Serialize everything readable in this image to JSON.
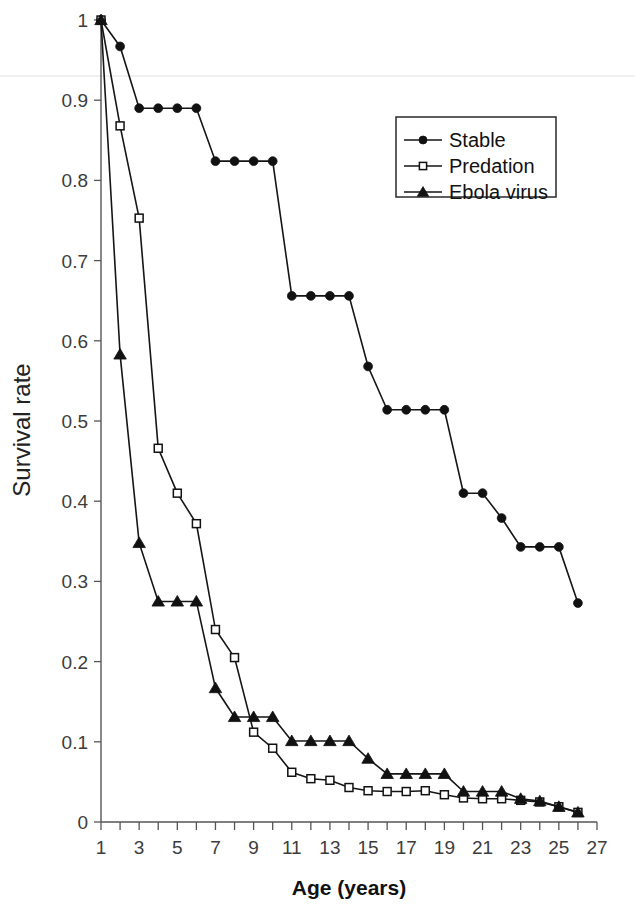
{
  "chart_data": {
    "type": "line",
    "title": "",
    "xlabel": "Age (years)",
    "ylabel": "Survival rate",
    "xlim": [
      1,
      27
    ],
    "ylim": [
      0,
      1
    ],
    "grid": false,
    "legend_position": "top-right",
    "x_tick_labels": [
      "1",
      "3",
      "5",
      "7",
      "9",
      "11",
      "13",
      "15",
      "17",
      "19",
      "21",
      "23",
      "25",
      "27"
    ],
    "x_tick_values": [
      1,
      3,
      5,
      7,
      9,
      11,
      13,
      15,
      17,
      19,
      21,
      23,
      25,
      27
    ],
    "x_minor_ticks": [
      1,
      2,
      3,
      4,
      5,
      6,
      7,
      8,
      9,
      10,
      11,
      12,
      13,
      14,
      15,
      16,
      17,
      18,
      19,
      20,
      21,
      22,
      23,
      24,
      25,
      26,
      27
    ],
    "y_tick_labels": [
      "0",
      "0.1",
      "0.2",
      "0.3",
      "0.4",
      "0.5",
      "0.6",
      "0.7",
      "0.8",
      "0.9",
      "1"
    ],
    "y_tick_values": [
      0,
      0.1,
      0.2,
      0.3,
      0.4,
      0.5,
      0.6,
      0.7,
      0.8,
      0.9,
      1
    ],
    "x": [
      1,
      2,
      3,
      4,
      5,
      6,
      7,
      8,
      9,
      10,
      11,
      12,
      13,
      14,
      15,
      16,
      17,
      18,
      19,
      20,
      21,
      22,
      23,
      24,
      25,
      26
    ],
    "series": [
      {
        "name": "Stable",
        "marker": "filled-circle",
        "values": [
          1.0,
          0.967,
          0.89,
          0.89,
          0.89,
          0.89,
          0.824,
          0.824,
          0.824,
          0.824,
          0.656,
          0.656,
          0.656,
          0.656,
          0.568,
          0.514,
          0.514,
          0.514,
          0.514,
          0.41,
          0.41,
          0.379,
          0.343,
          0.343,
          0.343,
          0.273
        ]
      },
      {
        "name": "Predation",
        "marker": "open-square",
        "values": [
          1.0,
          0.868,
          0.753,
          0.466,
          0.41,
          0.372,
          0.24,
          0.205,
          0.112,
          0.092,
          0.062,
          0.054,
          0.052,
          0.043,
          0.039,
          0.038,
          0.038,
          0.039,
          0.034,
          0.03,
          0.029,
          0.029,
          0.027,
          0.025,
          0.019,
          0.012
        ]
      },
      {
        "name": "Ebola virus",
        "marker": "filled-triangle",
        "values": [
          1.0,
          0.583,
          0.348,
          0.275,
          0.275,
          0.275,
          0.167,
          0.131,
          0.131,
          0.131,
          0.101,
          0.101,
          0.101,
          0.101,
          0.079,
          0.06,
          0.06,
          0.06,
          0.06,
          0.038,
          0.038,
          0.038,
          0.029,
          0.026,
          0.019,
          0.012
        ]
      }
    ]
  },
  "legend": {
    "entries": [
      {
        "label": "Stable",
        "marker": "filled-circle"
      },
      {
        "label": "Predation",
        "marker": "open-square"
      },
      {
        "label": "Ebola virus",
        "marker": "filled-triangle"
      }
    ]
  },
  "colors": {
    "ink": "#111111",
    "axis": "#555555",
    "background": "#ffffff"
  }
}
